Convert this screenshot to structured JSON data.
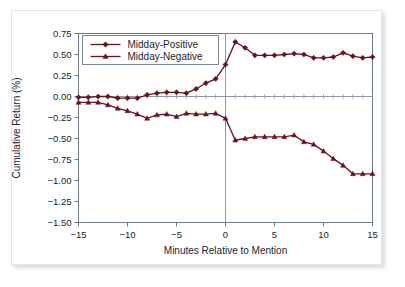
{
  "chart_data": {
    "type": "line",
    "title": "",
    "xlabel": "Minutes Relative to Mention",
    "ylabel": "Cumulative Return (%)",
    "xlim": [
      -15,
      15
    ],
    "ylim": [
      -1.5,
      0.75
    ],
    "xticks": [
      -15,
      -10,
      -5,
      0,
      5,
      10,
      15
    ],
    "xtick_labels": [
      "−15",
      "−10",
      "−5",
      "0",
      "5",
      "10",
      "15"
    ],
    "yticks": [
      0.75,
      0.5,
      0.25,
      0.0,
      -0.25,
      -0.5,
      -0.75,
      -1.0,
      -1.25,
      -1.5
    ],
    "ytick_labels": [
      "0.75",
      "0.50",
      "0.25",
      "0.00",
      "−0.25",
      "−0.50",
      "−0.75",
      "−1.00",
      "−1.25",
      "−1.50"
    ],
    "grid": false,
    "zero_line": true,
    "event_line_x": 0,
    "legend_position": "upper left",
    "x": [
      -15,
      -14,
      -13,
      -12,
      -11,
      -10,
      -9,
      -8,
      -7,
      -6,
      -5,
      -4,
      -3,
      -2,
      -1,
      0,
      1,
      2,
      3,
      4,
      5,
      6,
      7,
      8,
      9,
      10,
      11,
      12,
      13,
      14,
      15
    ],
    "series": [
      {
        "name": "Midday-Positive",
        "marker": "diamond",
        "color": "#6B1220",
        "values": [
          -0.01,
          -0.01,
          0.0,
          0.0,
          -0.02,
          -0.02,
          -0.02,
          0.02,
          0.04,
          0.05,
          0.05,
          0.04,
          0.09,
          0.16,
          0.21,
          0.38,
          0.65,
          0.58,
          0.49,
          0.49,
          0.49,
          0.5,
          0.51,
          0.5,
          0.46,
          0.46,
          0.47,
          0.52,
          0.48,
          0.46,
          0.47
        ]
      },
      {
        "name": "Midday-Negative",
        "marker": "triangle",
        "color": "#6B1220",
        "values": [
          -0.07,
          -0.07,
          -0.07,
          -0.1,
          -0.14,
          -0.17,
          -0.21,
          -0.26,
          -0.22,
          -0.21,
          -0.24,
          -0.2,
          -0.21,
          -0.21,
          -0.2,
          -0.26,
          -0.52,
          -0.5,
          -0.48,
          -0.48,
          -0.48,
          -0.48,
          -0.46,
          -0.54,
          -0.57,
          -0.65,
          -0.74,
          -0.82,
          -0.92,
          -0.92,
          -0.92
        ]
      }
    ]
  },
  "legend": {
    "items": [
      {
        "label": "Midday-Positive"
      },
      {
        "label": "Midday-Negative"
      }
    ]
  },
  "colors": {
    "line": "#6B1220",
    "axis": "#6e7a86",
    "text": "#1b2430",
    "frame": "#e3e6ea",
    "background": "#ffffff"
  }
}
